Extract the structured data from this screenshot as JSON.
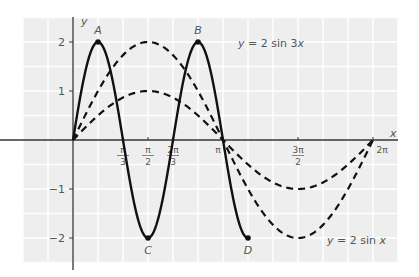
{
  "chart_data": {
    "type": "line",
    "title": "",
    "xlabel": "x",
    "ylabel": "y",
    "xlim": [
      -1.0,
      6.6
    ],
    "ylim": [
      -2.4,
      2.5
    ],
    "grid": true,
    "x_ticks": [
      {
        "value": 1.0472,
        "label_num": "π",
        "label_den": "3"
      },
      {
        "value": 1.5708,
        "label_num": "π",
        "label_den": "2"
      },
      {
        "value": 2.0944,
        "label_num": "2π",
        "label_den": "3"
      },
      {
        "value": 3.1416,
        "label_num": "π",
        "label_den": ""
      },
      {
        "value": 4.7124,
        "label_num": "3π",
        "label_den": "2"
      },
      {
        "value": 6.2832,
        "label_num": "2π",
        "label_den": ""
      }
    ],
    "y_ticks": [
      {
        "value": 2,
        "label": "2"
      },
      {
        "value": 1,
        "label": "1"
      },
      {
        "value": -1,
        "label": "−1"
      },
      {
        "value": -2,
        "label": "−2"
      }
    ],
    "series": [
      {
        "name": "y = 2 sin 3x",
        "expr": "2*sin(3x)",
        "style": "solid",
        "domain": [
          0,
          3.6652
        ],
        "label": "y = 2 sin 3x",
        "label_pos": [
          238,
          47
        ]
      },
      {
        "name": "y = 2 sin x",
        "expr": "2*sin(x)",
        "style": "dashed",
        "domain": [
          0,
          6.2832
        ],
        "label": "y = 2 sin x",
        "label_pos": [
          327,
          244
        ]
      },
      {
        "name": "y = sin x",
        "expr": "sin(x)",
        "style": "dashed",
        "domain": [
          0,
          6.2832
        ],
        "label": ""
      }
    ],
    "points": [
      {
        "name": "A",
        "x": 0.5236,
        "y": 2,
        "label_dx": 0,
        "label_dy": -8
      },
      {
        "name": "B",
        "x": 2.618,
        "y": 2,
        "label_dx": 0,
        "label_dy": -8
      },
      {
        "name": "C",
        "x": 1.5708,
        "y": -2,
        "label_dx": 0,
        "label_dy": 16
      },
      {
        "name": "D",
        "x": 3.6652,
        "y": -2,
        "label_dx": 0,
        "label_dy": 16
      }
    ]
  },
  "colors": {
    "plot_bg": "#eeeeee",
    "grid": "#ffffff",
    "axis": "#333333",
    "curve": "#111111",
    "text": "#555555"
  }
}
